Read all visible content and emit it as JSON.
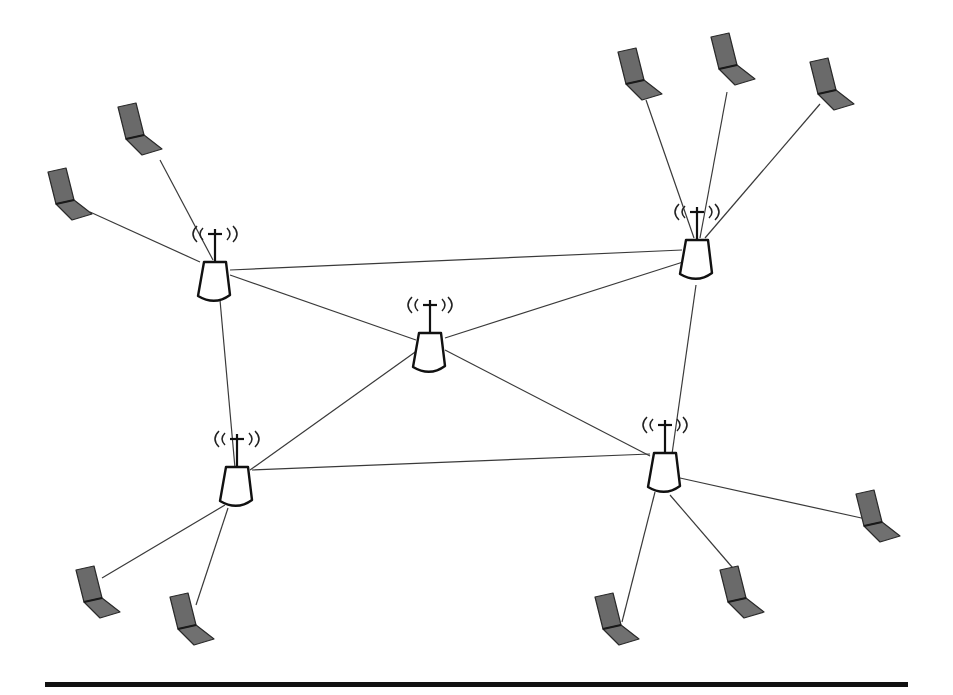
{
  "diagram": {
    "type": "wireless mesh network",
    "colors": {
      "line": "#3a3a3a",
      "router_stroke": "#111111",
      "laptop_fill": "#6a6a6a",
      "rule": "#111111"
    },
    "routers": [
      {
        "id": "router-top-left",
        "x": 215,
        "y": 262,
        "icon": "wireless-router-icon"
      },
      {
        "id": "router-top-right",
        "x": 697,
        "y": 240,
        "icon": "wireless-router-icon"
      },
      {
        "id": "router-center",
        "x": 430,
        "y": 333,
        "icon": "wireless-router-icon"
      },
      {
        "id": "router-bottom-left",
        "x": 237,
        "y": 467,
        "icon": "wireless-router-icon"
      },
      {
        "id": "router-bottom-right",
        "x": 665,
        "y": 453,
        "icon": "wireless-router-icon"
      }
    ],
    "laptops": [
      {
        "id": "laptop-tl-1",
        "x": 140,
        "y": 135,
        "router": "router-top-left",
        "icon": "laptop-icon"
      },
      {
        "id": "laptop-tl-2",
        "x": 70,
        "y": 200,
        "router": "router-top-left",
        "icon": "laptop-icon"
      },
      {
        "id": "laptop-tr-1",
        "x": 640,
        "y": 80,
        "router": "router-top-right",
        "icon": "laptop-icon"
      },
      {
        "id": "laptop-tr-2",
        "x": 733,
        "y": 65,
        "router": "router-top-right",
        "icon": "laptop-icon"
      },
      {
        "id": "laptop-tr-3",
        "x": 832,
        "y": 90,
        "router": "router-top-right",
        "icon": "laptop-icon"
      },
      {
        "id": "laptop-bl-1",
        "x": 98,
        "y": 598,
        "router": "router-bottom-left",
        "icon": "laptop-icon"
      },
      {
        "id": "laptop-bl-2",
        "x": 192,
        "y": 625,
        "router": "router-bottom-left",
        "icon": "laptop-icon"
      },
      {
        "id": "laptop-br-1",
        "x": 617,
        "y": 625,
        "router": "router-bottom-right",
        "icon": "laptop-icon"
      },
      {
        "id": "laptop-br-2",
        "x": 742,
        "y": 598,
        "router": "router-bottom-right",
        "icon": "laptop-icon"
      },
      {
        "id": "laptop-br-3",
        "x": 878,
        "y": 522,
        "router": "router-bottom-right",
        "icon": "laptop-icon"
      }
    ],
    "router_links": [
      [
        "router-top-left",
        "router-top-right"
      ],
      [
        "router-top-left",
        "router-center"
      ],
      [
        "router-top-left",
        "router-bottom-left"
      ],
      [
        "router-top-right",
        "router-center"
      ],
      [
        "router-top-right",
        "router-bottom-right"
      ],
      [
        "router-center",
        "router-bottom-left"
      ],
      [
        "router-center",
        "router-bottom-right"
      ],
      [
        "router-bottom-left",
        "router-bottom-right"
      ]
    ],
    "bottom_rule": {
      "x1": 45,
      "x2": 908,
      "y": 684
    }
  }
}
